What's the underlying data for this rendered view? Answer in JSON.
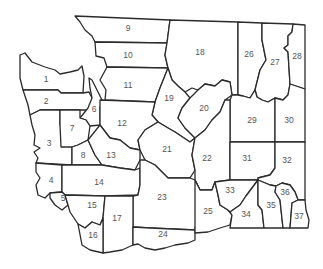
{
  "map": {
    "subject": "Washington State",
    "region_count": 37,
    "colors": {
      "fill": "#ffffff",
      "stroke": "#2b2b2b",
      "label": "#555555"
    },
    "regions": [
      {
        "id": 1,
        "label": "1"
      },
      {
        "id": 2,
        "label": "2"
      },
      {
        "id": 3,
        "label": "3"
      },
      {
        "id": 4,
        "label": "4"
      },
      {
        "id": 5,
        "label": "5"
      },
      {
        "id": 6,
        "label": "6"
      },
      {
        "id": 7,
        "label": "7"
      },
      {
        "id": 8,
        "label": "8"
      },
      {
        "id": 9,
        "label": "9"
      },
      {
        "id": 10,
        "label": "10"
      },
      {
        "id": 11,
        "label": "11"
      },
      {
        "id": 12,
        "label": "12"
      },
      {
        "id": 13,
        "label": "13"
      },
      {
        "id": 14,
        "label": "14"
      },
      {
        "id": 15,
        "label": "15"
      },
      {
        "id": 16,
        "label": "16"
      },
      {
        "id": 17,
        "label": "17"
      },
      {
        "id": 18,
        "label": "18"
      },
      {
        "id": 19,
        "label": "19"
      },
      {
        "id": 20,
        "label": "20"
      },
      {
        "id": 21,
        "label": "21"
      },
      {
        "id": 22,
        "label": "22"
      },
      {
        "id": 23,
        "label": "23"
      },
      {
        "id": 24,
        "label": "24"
      },
      {
        "id": 25,
        "label": "25"
      },
      {
        "id": 26,
        "label": "26"
      },
      {
        "id": 27,
        "label": "27"
      },
      {
        "id": 28,
        "label": "28"
      },
      {
        "id": 29,
        "label": "29"
      },
      {
        "id": 30,
        "label": "30"
      },
      {
        "id": 31,
        "label": "31"
      },
      {
        "id": 32,
        "label": "32"
      },
      {
        "id": 33,
        "label": "33"
      },
      {
        "id": 34,
        "label": "34"
      },
      {
        "id": 35,
        "label": "35"
      },
      {
        "id": 36,
        "label": "36"
      },
      {
        "id": 37,
        "label": "37"
      }
    ]
  }
}
